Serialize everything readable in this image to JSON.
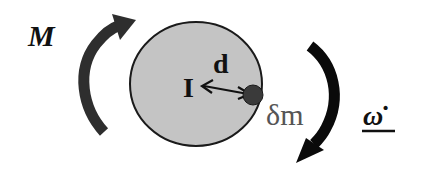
{
  "diagram": {
    "labels": {
      "moment": "M",
      "inertia": "I",
      "distance": "d",
      "mass_element": "δm",
      "angular_acceleration": "ω̇"
    },
    "colors": {
      "disk_fill": "#c4c4c4",
      "disk_stroke": "#1a1a1a",
      "mass_point": "#3a3a3a",
      "moment_arrow": "#2e2e2e",
      "omega_arrow": "#0a0a0a",
      "mass_label": "#555555",
      "text": "#111111"
    }
  }
}
